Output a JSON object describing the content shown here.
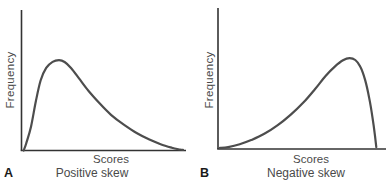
{
  "figure": {
    "background": "#ffffff",
    "axis_color": "#333333",
    "curve_color": "#4d4d4d",
    "text_color": "#4a4a4a",
    "letter_color": "#1a1a1a"
  },
  "chart_data": [
    {
      "type": "line",
      "panel_letter": "A",
      "caption": "Positive skew",
      "xlabel": "Scores",
      "ylabel": "Frequency",
      "axis_ticks": "none",
      "grid": "off",
      "legend": "none",
      "units": "normalized (no tick labels shown; x 0-1 along Scores axis, y 0-1 of Frequency axis height)",
      "x": [
        0.004,
        0.02,
        0.05,
        0.08,
        0.11,
        0.145,
        0.185,
        0.225,
        0.26,
        0.3,
        0.35,
        0.41,
        0.48,
        0.55,
        0.63,
        0.71,
        0.79,
        0.86,
        0.93,
        0.98,
        1.0
      ],
      "y": [
        0.0,
        0.05,
        0.17,
        0.35,
        0.5,
        0.59,
        0.633,
        0.645,
        0.632,
        0.59,
        0.515,
        0.425,
        0.335,
        0.255,
        0.185,
        0.125,
        0.078,
        0.045,
        0.02,
        0.007,
        0.004
      ],
      "peak_x": 0.225,
      "skew_direction": "right tail (positive)"
    },
    {
      "type": "line",
      "panel_letter": "B",
      "caption": "Negative skew",
      "xlabel": "Scores",
      "ylabel": "Frequency",
      "axis_ticks": "none",
      "grid": "off",
      "legend": "none",
      "units": "normalized (no tick labels shown; x 0-1 along Scores axis, y 0-1 of Frequency axis height)",
      "x": [
        0.0,
        0.05,
        0.12,
        0.19,
        0.27,
        0.35,
        0.43,
        0.51,
        0.58,
        0.645,
        0.7,
        0.75,
        0.79,
        0.825,
        0.855,
        0.885,
        0.91,
        0.93,
        0.945,
        0.953
      ],
      "y": [
        0.004,
        0.01,
        0.03,
        0.06,
        0.105,
        0.165,
        0.24,
        0.33,
        0.425,
        0.52,
        0.585,
        0.63,
        0.645,
        0.632,
        0.585,
        0.49,
        0.36,
        0.22,
        0.09,
        0.01
      ],
      "peak_x": 0.79,
      "skew_direction": "left tail (negative)"
    }
  ]
}
